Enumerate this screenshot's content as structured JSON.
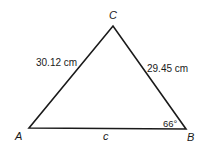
{
  "diagram": {
    "type": "triangle",
    "vertices": {
      "A": {
        "label": "A",
        "x": 29,
        "y": 128
      },
      "B": {
        "label": "B",
        "x": 186,
        "y": 129
      },
      "C": {
        "label": "C",
        "x": 113,
        "y": 26
      }
    },
    "sides": {
      "AC": {
        "label": "30.12 cm"
      },
      "BC": {
        "label": "29.45 cm"
      },
      "AB": {
        "label": "c"
      }
    },
    "angles": {
      "B": {
        "label": "66°"
      }
    },
    "colors": {
      "stroke": "#1a1a1a",
      "background": "#ffffff"
    }
  }
}
